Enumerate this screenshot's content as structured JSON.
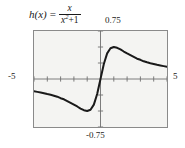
{
  "formula": {
    "function_name": "h(x)",
    "equals": "=",
    "numerator": "x",
    "denominator_base": "x",
    "denominator_exponent": "2",
    "denominator_operator": "+",
    "denominator_constant": "1",
    "full_text": "h(x) = x/(x^2 + 1)"
  },
  "labels": {
    "y_max": "0.75",
    "y_min": "-0.75",
    "x_min": "-5",
    "x_max": "5"
  },
  "colors": {
    "plot_background": "#f4f4f2",
    "frame": "#8a8a8a",
    "curve": "#1a1a1a",
    "axis": "#6f6f6f",
    "page_background": "#ffffff"
  },
  "chart_data": {
    "type": "line",
    "xlabel": "",
    "ylabel": "",
    "xlim": [
      -5,
      5
    ],
    "ylim": [
      -0.75,
      0.75
    ],
    "grid": false,
    "legend": "none",
    "x_tick_labels": [
      "-5",
      "5"
    ],
    "y_tick_labels": [
      "-0.75",
      "0.75"
    ],
    "x_tick_interval": 1,
    "y_tick_interval": 0.25,
    "annotations": [
      {
        "text": "maximum at x = 1, h = 0.5"
      },
      {
        "text": "minimum at x = -1, h = -0.5"
      },
      {
        "text": "passes through origin (0, 0)"
      }
    ],
    "series": [
      {
        "name": "h(x) = x/(x^2 + 1)",
        "x": [
          -5,
          -4.75,
          -4.5,
          -4.25,
          -4,
          -3.75,
          -3.5,
          -3.25,
          -3,
          -2.75,
          -2.5,
          -2.25,
          -2,
          -1.75,
          -1.5,
          -1.25,
          -1,
          -0.75,
          -0.5,
          -0.25,
          0,
          0.25,
          0.5,
          0.75,
          1,
          1.25,
          1.5,
          1.75,
          2,
          2.25,
          2.5,
          2.75,
          3,
          3.25,
          3.5,
          3.75,
          4,
          4.25,
          4.5,
          4.75,
          5
        ],
        "values": [
          -0.1923,
          -0.2012,
          -0.2108,
          -0.2212,
          -0.2353,
          -0.2466,
          -0.2605,
          -0.2762,
          -0.3,
          -0.3172,
          -0.3448,
          -0.3729,
          -0.4,
          -0.4295,
          -0.4615,
          -0.4878,
          -0.5,
          -0.48,
          -0.4,
          -0.2353,
          0,
          0.2353,
          0.4,
          0.48,
          0.5,
          0.4878,
          0.4615,
          0.4295,
          0.4,
          0.3729,
          0.3448,
          0.3172,
          0.3,
          0.2762,
          0.2605,
          0.2466,
          0.2353,
          0.2212,
          0.2108,
          0.2012,
          0.1923
        ]
      }
    ]
  }
}
